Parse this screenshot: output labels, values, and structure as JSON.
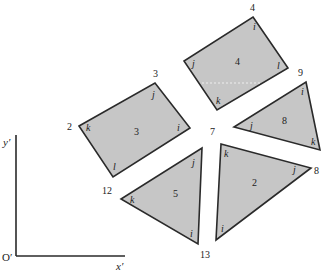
{
  "axes": {
    "y_label": "y′",
    "x_label": "x′",
    "origin_label": "O′"
  },
  "shapes": [
    {
      "id": "3",
      "type": "rectangle",
      "points": "79,126 155,83 190,128 113,177",
      "center_label": "3",
      "corner_labels": [
        "k",
        "j",
        "i",
        "l"
      ]
    },
    {
      "id": "4",
      "type": "rectangle",
      "points": "253,17 288,68 217,110 184,61",
      "center_label": "4",
      "corner_labels": [
        "i",
        "l",
        "k",
        "j"
      ]
    },
    {
      "id": "8",
      "type": "triangle",
      "points": "306,82 320,150 234,127",
      "center_label": "8",
      "corner_labels": [
        "i",
        "k",
        "j"
      ]
    },
    {
      "id": "2",
      "type": "triangle",
      "points": "221,144 311,168 216,240",
      "center_label": "2",
      "corner_labels": [
        "k",
        "j",
        "i"
      ]
    },
    {
      "id": "5",
      "type": "triangle",
      "points": "202,148 198,244 121,199",
      "center_label": "5",
      "corner_labels": [
        "j",
        "i",
        "k"
      ]
    }
  ],
  "vertex_numbers": {
    "v2": "2",
    "v3": "3",
    "v4": "4",
    "v7": "7",
    "v8": "8",
    "v9": "9",
    "v12": "12",
    "v13": "13"
  },
  "colors": {
    "fill": "#c6c6c6",
    "stroke": "#2a2a2a"
  }
}
